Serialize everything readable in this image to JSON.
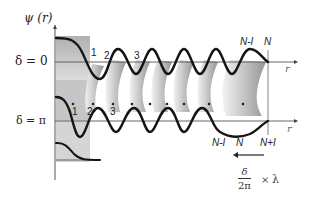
{
  "figure": {
    "y_axis_label": "ψ (r)",
    "x_axis_label": "r",
    "rows": [
      {
        "label": "δ = 0",
        "site_labels": [
          "1",
          "2",
          "3",
          "N-I",
          "N"
        ]
      },
      {
        "label": "δ = π",
        "site_labels": [
          "1",
          "2",
          "3",
          "N-I",
          "N",
          "N+I"
        ]
      }
    ],
    "shift_annotation": {
      "numerator": "δ",
      "denominator": "2π",
      "times": "×",
      "factor": "λ"
    },
    "colors": {
      "curve": "#1a1a1a",
      "axis": "#555555",
      "shade_dark": "#9a9a9a",
      "shade_light": "#e6e6e6",
      "text": "#222222"
    }
  }
}
